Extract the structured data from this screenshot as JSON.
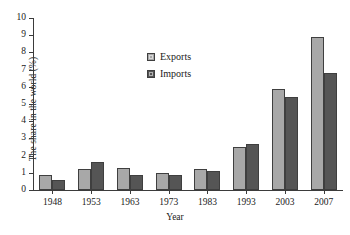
{
  "chart_data": {
    "type": "bar",
    "title": "",
    "xlabel": "Year",
    "ylabel": "The share in the world (%)",
    "categories": [
      "1948",
      "1953",
      "1963",
      "1973",
      "1983",
      "1993",
      "2003",
      "2007"
    ],
    "series": [
      {
        "name": "Exports",
        "color": "#a8a8a8",
        "values": [
          0.9,
          1.2,
          1.3,
          1.0,
          1.2,
          2.5,
          5.9,
          8.9
        ]
      },
      {
        "name": "Imports",
        "color": "#555555",
        "values": [
          0.6,
          1.6,
          0.9,
          0.9,
          1.1,
          2.7,
          5.4,
          6.8
        ]
      }
    ],
    "ylim": [
      0,
      10
    ],
    "yticks": [
      "0",
      "1",
      "2",
      "3",
      "4",
      "5",
      "6",
      "7",
      "8",
      "9",
      "10"
    ],
    "grid": false,
    "legend_position": "upper-center"
  }
}
